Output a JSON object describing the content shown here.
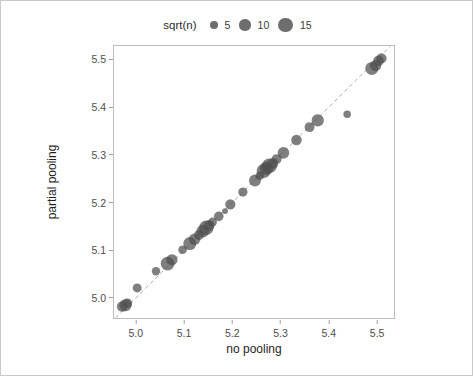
{
  "legend": {
    "title": "sqrt(n)",
    "keys": [
      {
        "label": "5",
        "value": 5,
        "radius_px": 4.0
      },
      {
        "label": "10",
        "value": 10,
        "radius_px": 5.6
      },
      {
        "label": "15",
        "value": 15,
        "radius_px": 7.4
      }
    ],
    "position": "top",
    "marker_color": "#6e6e6e"
  },
  "axes": {
    "x": {
      "label": "no pooling",
      "ticks": [
        "5.0",
        "5.1",
        "5.2",
        "5.3",
        "5.4",
        "5.5"
      ],
      "tick_values": [
        5.0,
        5.1,
        5.2,
        5.3,
        5.4,
        5.5
      ],
      "min": 4.955,
      "max": 5.535
    },
    "y": {
      "label": "partial pooling",
      "ticks": [
        "5.0",
        "5.1",
        "5.2",
        "5.3",
        "5.4",
        "5.5"
      ],
      "tick_values": [
        5.0,
        5.1,
        5.2,
        5.3,
        5.4,
        5.5
      ],
      "min": 4.958,
      "max": 5.528
    }
  },
  "style": {
    "point_color": "#4d4d4d",
    "point_opacity": 0.72,
    "panel_border": "#bdbdbd",
    "figure_border": "#c9c9c9",
    "refline_color": "#adadad",
    "refline_dash": "4 3",
    "background": "#ffffff"
  },
  "chart_data": {
    "type": "scatter",
    "title": "",
    "xlabel": "no pooling",
    "ylabel": "partial pooling",
    "xlim": [
      4.955,
      5.535
    ],
    "ylim": [
      4.958,
      5.528
    ],
    "grid": false,
    "legend_position": "top",
    "size_legend": {
      "name": "sqrt(n)",
      "breaks": [
        5,
        10,
        15
      ]
    },
    "annotations": [
      {
        "type": "reference-line",
        "description": "dashed identity line y = x",
        "slope": 1,
        "intercept": 0,
        "style": "dashed",
        "color": "#adadad"
      }
    ],
    "series": [
      {
        "name": "counties",
        "point_color": "#4d4d4d",
        "size_variable": "sqrt(n)",
        "points": [
          {
            "x": 4.972,
            "y": 4.982,
            "size": 9.0
          },
          {
            "x": 4.979,
            "y": 4.985,
            "size": 11.5
          },
          {
            "x": 4.983,
            "y": 4.989,
            "size": 7.0
          },
          {
            "x": 5.003,
            "y": 5.021,
            "size": 6.5
          },
          {
            "x": 5.042,
            "y": 5.056,
            "size": 5.5
          },
          {
            "x": 5.066,
            "y": 5.072,
            "size": 13.5
          },
          {
            "x": 5.075,
            "y": 5.08,
            "size": 10.0
          },
          {
            "x": 5.097,
            "y": 5.101,
            "size": 6.0
          },
          {
            "x": 5.112,
            "y": 5.114,
            "size": 12.5
          },
          {
            "x": 5.122,
            "y": 5.123,
            "size": 10.5
          },
          {
            "x": 5.131,
            "y": 5.132,
            "size": 8.0
          },
          {
            "x": 5.139,
            "y": 5.14,
            "size": 12.0
          },
          {
            "x": 5.146,
            "y": 5.147,
            "size": 14.5
          },
          {
            "x": 5.152,
            "y": 5.152,
            "size": 9.5
          },
          {
            "x": 5.159,
            "y": 5.159,
            "size": 6.5
          },
          {
            "x": 5.172,
            "y": 5.171,
            "size": 7.5
          },
          {
            "x": 5.185,
            "y": 5.182,
            "size": 3.0
          },
          {
            "x": 5.196,
            "y": 5.196,
            "size": 8.5
          },
          {
            "x": 5.222,
            "y": 5.222,
            "size": 7.0
          },
          {
            "x": 5.247,
            "y": 5.246,
            "size": 11.0
          },
          {
            "x": 5.257,
            "y": 5.256,
            "size": 6.0
          },
          {
            "x": 5.265,
            "y": 5.266,
            "size": 14.0
          },
          {
            "x": 5.271,
            "y": 5.272,
            "size": 13.0
          },
          {
            "x": 5.277,
            "y": 5.277,
            "size": 15.0
          },
          {
            "x": 5.284,
            "y": 5.282,
            "size": 9.5
          },
          {
            "x": 5.292,
            "y": 5.291,
            "size": 8.0
          },
          {
            "x": 5.306,
            "y": 5.304,
            "size": 10.5
          },
          {
            "x": 5.333,
            "y": 5.331,
            "size": 9.0
          },
          {
            "x": 5.36,
            "y": 5.358,
            "size": 8.0
          },
          {
            "x": 5.377,
            "y": 5.372,
            "size": 11.5
          },
          {
            "x": 5.438,
            "y": 5.385,
            "size": 4.5
          },
          {
            "x": 5.489,
            "y": 5.481,
            "size": 12.5
          },
          {
            "x": 5.497,
            "y": 5.487,
            "size": 10.0
          },
          {
            "x": 5.503,
            "y": 5.497,
            "size": 9.0
          },
          {
            "x": 5.509,
            "y": 5.502,
            "size": 8.5
          }
        ]
      }
    ]
  }
}
